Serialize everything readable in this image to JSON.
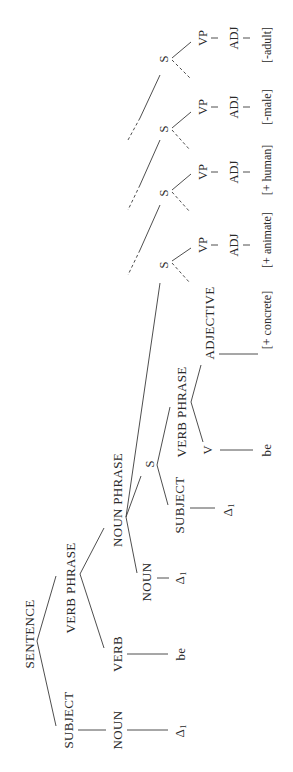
{
  "diagram": {
    "root": {
      "label": "SENTENCE",
      "subject": {
        "label": "SUBJECT",
        "noun": "NOUN",
        "terminal": "Δ",
        "terminal_sub": "1"
      },
      "verb_phrase": {
        "label": "VERB PHRASE",
        "verb": "VERB",
        "verb_terminal": "be",
        "noun_phrase": {
          "label": "NOUN PHRASE",
          "noun": "NOUN",
          "terminal": "Δ",
          "terminal_sub": "1",
          "embedded_s": {
            "label": "S",
            "subject": {
              "label": "SUBJECT",
              "terminal": "Δ",
              "terminal_sub": "1"
            },
            "verb_phrase": {
              "label": "VERB PHRASE",
              "v": "V",
              "v_terminal": "be",
              "adjective": "ADJECTIVE",
              "feature": "[+ concrete]"
            }
          },
          "chain": [
            {
              "s": "S",
              "vp": "VP",
              "adj": "ADJ",
              "feature": "[+ animate]"
            },
            {
              "s": "S",
              "vp": "VP",
              "adj": "ADJ",
              "feature": "[+ human]"
            },
            {
              "s": "S",
              "vp": "VP",
              "adj": "ADJ",
              "feature": "[-male]"
            },
            {
              "s": "S",
              "vp": "VP",
              "adj": "ADJ",
              "feature": "[-adult]"
            }
          ]
        }
      }
    }
  }
}
